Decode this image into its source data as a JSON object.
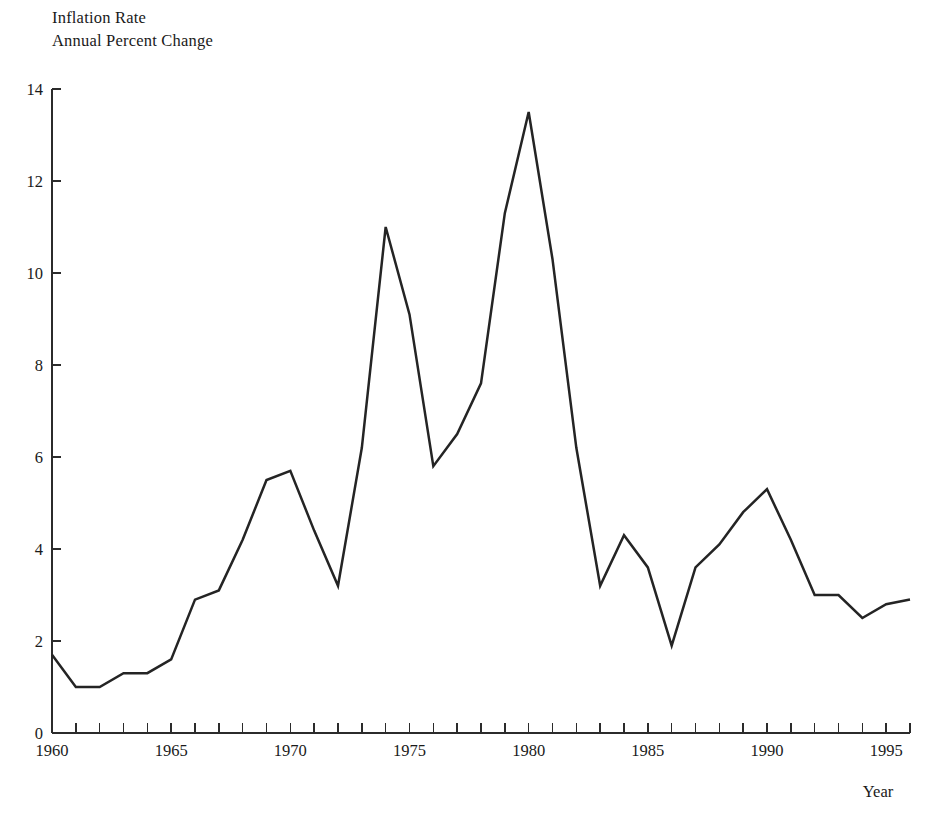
{
  "chart_data": {
    "type": "line",
    "title": "Inflation Rate",
    "subtitle": "Annual Percent Change",
    "xlabel": "Year",
    "ylabel": "",
    "xlim": [
      1960,
      1996
    ],
    "ylim": [
      0,
      14
    ],
    "ytick_step": 2,
    "xtick_step": 1,
    "xtick_label_step": 5,
    "grid": false,
    "legend": null,
    "line_color": "#242424",
    "axis_color": "#2b2b2b",
    "background": "#ffffff",
    "y_ticks": [
      0,
      2,
      4,
      6,
      8,
      10,
      12,
      14
    ],
    "y_tick_labels": [
      "0",
      "2",
      "4",
      "6",
      "8",
      "10",
      "12",
      "14"
    ],
    "x_ticks": [
      1960,
      1961,
      1962,
      1963,
      1964,
      1965,
      1966,
      1967,
      1968,
      1969,
      1970,
      1971,
      1972,
      1973,
      1974,
      1975,
      1976,
      1977,
      1978,
      1979,
      1980,
      1981,
      1982,
      1983,
      1984,
      1985,
      1986,
      1987,
      1988,
      1989,
      1990,
      1991,
      1992,
      1993,
      1994,
      1995,
      1996
    ],
    "x_tick_labels": [
      "1960",
      "1965",
      "1970",
      "1975",
      "1980",
      "1985",
      "1990",
      "1995"
    ],
    "x_tick_label_years": [
      1960,
      1965,
      1970,
      1975,
      1980,
      1985,
      1990,
      1995
    ],
    "x": [
      1960,
      1961,
      1962,
      1963,
      1964,
      1965,
      1966,
      1967,
      1968,
      1969,
      1970,
      1971,
      1972,
      1973,
      1974,
      1975,
      1976,
      1977,
      1978,
      1979,
      1980,
      1981,
      1982,
      1983,
      1984,
      1985,
      1986,
      1987,
      1988,
      1989,
      1990,
      1991,
      1992,
      1993,
      1994,
      1995,
      1996
    ],
    "values": [
      1.7,
      1.0,
      1.0,
      1.3,
      1.3,
      1.6,
      2.9,
      3.1,
      4.2,
      5.5,
      5.7,
      4.4,
      3.2,
      6.2,
      11.0,
      9.1,
      5.8,
      6.5,
      7.6,
      11.3,
      13.5,
      10.3,
      6.2,
      3.2,
      4.3,
      3.6,
      1.9,
      3.6,
      4.1,
      4.8,
      5.3,
      4.2,
      3.0,
      3.0,
      2.5,
      2.8,
      2.9
    ]
  },
  "labels": {
    "title": "Inflation Rate",
    "subtitle": "Annual Percent Change",
    "x_axis_name": "Year"
  }
}
